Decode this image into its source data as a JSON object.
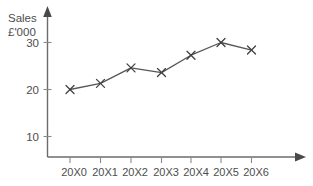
{
  "chart_data": {
    "type": "line",
    "title": "",
    "ylabel_lines": [
      "Sales",
      "£'000"
    ],
    "xlabel": "",
    "categories": [
      "20X0",
      "20X1",
      "20X2",
      "20X3",
      "20X4",
      "20X5",
      "20X6"
    ],
    "values": [
      20.0,
      21.3,
      24.6,
      23.6,
      27.3,
      30.0,
      28.4
    ],
    "series": [
      {
        "name": "Sales",
        "values": [
          20.0,
          21.3,
          24.6,
          23.6,
          27.3,
          30.0,
          28.4
        ]
      }
    ],
    "ytick_labels": [
      "30",
      "20",
      "10"
    ],
    "ytick_values": [
      30,
      20,
      10
    ],
    "ylim": [
      0,
      34
    ],
    "xlim": [
      -0.55,
      7.3
    ],
    "grid": false,
    "legend": "none",
    "marker": "x",
    "line_color": "#57575a",
    "marker_color": "#3f3f42",
    "axis_color": "#6b6b6b",
    "text_color": "#4d4d4d",
    "background_color": "#ffffff",
    "axis_arrows": true
  }
}
